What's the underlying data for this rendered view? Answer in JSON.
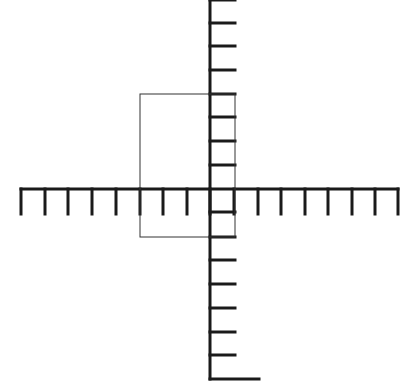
{
  "diagram": {
    "type": "coordinate-grid",
    "colors": {
      "background": "#ffffff",
      "axis": "#1a1a1a",
      "rectangle": "#333333"
    },
    "horizontal_axis": {
      "y": 189,
      "x_start": 21,
      "x_end": 398,
      "tick_x": [
        21,
        45,
        68,
        92,
        116,
        140,
        163,
        187,
        210,
        234,
        258,
        281,
        305,
        328,
        352,
        375,
        398
      ],
      "tick_length": 25,
      "tick_direction": "down"
    },
    "vertical_axis": {
      "x": 210,
      "y_start": 0,
      "y_end": 379,
      "tick_y": [
        0,
        23,
        46,
        70,
        94,
        117,
        141,
        165,
        212,
        237,
        260,
        284,
        308,
        332,
        355
      ],
      "tick_length": 25,
      "tick_direction": "right",
      "bottom_bar_length": 49
    },
    "rectangle": {
      "left": 140,
      "top": 94,
      "right": 235,
      "bottom": 237
    }
  }
}
